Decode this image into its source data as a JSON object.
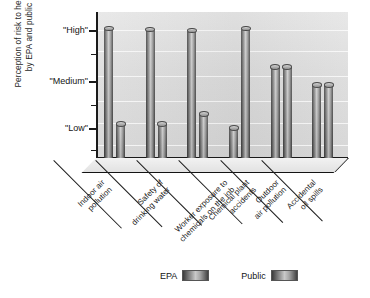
{
  "chart_data": {
    "type": "bar",
    "title": "",
    "subtitle": "",
    "xlabel": "",
    "ylabel": "Perception of risk to health\nby EPA and public",
    "grid": true,
    "legend_position": "bottom",
    "ylim": [
      0,
      3.25
    ],
    "ytick_values": [
      1,
      2,
      3
    ],
    "ytick_labels": [
      "\"Low\"",
      "\"Medium\"",
      "\"High\""
    ],
    "categories": [
      "Indoor air\npollution",
      "Safety of\ndrinking water",
      "Worker exposure to\nchemicals on the job",
      "Chemical plant\naccidents",
      "Outdoor\nair pollution",
      "Accidental\noil spills"
    ],
    "series": [
      {
        "name": "EPA",
        "values": [
          2.88,
          2.85,
          2.83,
          0.66,
          2.02,
          1.62
        ]
      },
      {
        "name": "Public",
        "values": [
          0.75,
          0.75,
          0.97,
          2.88,
          2.02,
          1.62
        ]
      }
    ]
  },
  "axes": {
    "y_title": "Perception of risk to health\nby EPA and public",
    "y_ticks": [
      {
        "label": "\"High\"",
        "top": 25
      },
      {
        "label": "\"Medium\"",
        "top": 76
      },
      {
        "label": "\"Low\"",
        "top": 123
      }
    ]
  },
  "legend": {
    "items": [
      {
        "label": "EPA",
        "swatch": "cylinder-swatch"
      },
      {
        "label": "Public",
        "swatch": "cylinder-swatch"
      }
    ]
  },
  "colors": {
    "plot_background": "#dcdcdc",
    "axis": "#1a1a1a",
    "bar_light": "#c9c9c9",
    "bar_dark": "#3a3a3a",
    "gridline": "#ffffff",
    "text": "#1c1c1c"
  }
}
